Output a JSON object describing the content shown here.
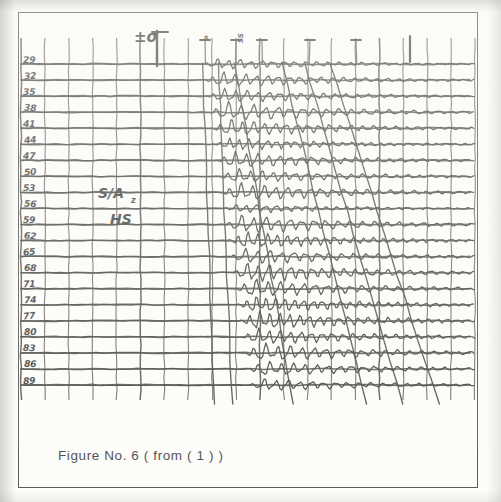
{
  "figure": {
    "caption": "Figure No. 6  ( from ( 1 ) )",
    "kind": "seismic-record-section"
  },
  "annotations": {
    "amplitude_scale_label": "±σ",
    "station_label": "S/A",
    "station_sublabel": "HS",
    "subscript": "z",
    "top_marks": [
      "1",
      "2",
      "3",
      "4",
      "5"
    ],
    "scribble_a": "P",
    "scribble_b": "SS"
  },
  "chart_data": {
    "type": "line",
    "title": "Figure No. 6  ( from ( 1 ) )",
    "xlabel": "",
    "ylabel": "",
    "grid": true,
    "legend": "none",
    "trace_axis_label": "trace number",
    "trace_labels": [
      "29",
      "32",
      "35",
      "38",
      "41",
      "44",
      "47",
      "50",
      "53",
      "56",
      "59",
      "62",
      "65",
      "68",
      "71",
      "74",
      "77",
      "80",
      "83",
      "86",
      "89"
    ],
    "trace_count": 21,
    "xlim": [
      0,
      100
    ],
    "ylim": [
      0,
      21
    ],
    "vertical_gridlines": 19,
    "moveout_lines": [
      {
        "name": "first-arrival",
        "x_top": 40.0,
        "x_bottom": 42.5
      },
      {
        "name": "branch-2",
        "x_top": 43.5,
        "x_bottom": 46.5
      },
      {
        "name": "branch-3",
        "x_top": 47.0,
        "x_bottom": 60.0
      },
      {
        "name": "branch-4",
        "x_top": 57.5,
        "x_bottom": 76.0
      },
      {
        "name": "branch-5",
        "x_top": 62.5,
        "x_bottom": 84.0
      },
      {
        "name": "branch-6",
        "x_top": 68.0,
        "x_bottom": 92.0
      }
    ],
    "onset_fraction": [
      0.4,
      0.405,
      0.41,
      0.415,
      0.42,
      0.425,
      0.43,
      0.435,
      0.44,
      0.445,
      0.45,
      0.455,
      0.46,
      0.465,
      0.47,
      0.475,
      0.48,
      0.485,
      0.49,
      0.495,
      0.5
    ],
    "packet_amplitude": [
      0.55,
      0.75,
      0.7,
      0.95,
      0.85,
      0.6,
      0.8,
      0.7,
      0.9,
      0.45,
      0.95,
      0.85,
      0.8,
      1.0,
      0.9,
      0.85,
      0.95,
      0.8,
      0.9,
      0.75,
      0.6
    ]
  },
  "colors": {
    "ink": "#1a1a1a",
    "grid": "#2a2a2a",
    "paper": "#fdfdfb",
    "frame": "#2c2c2c"
  }
}
